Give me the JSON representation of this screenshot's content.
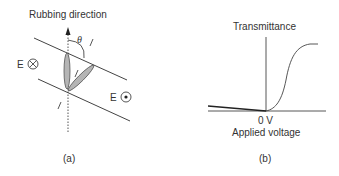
{
  "panel_a": {
    "caption": "(a)",
    "title": "Rubbing direction",
    "angle_label": "θ",
    "field_left": "E",
    "field_left_symbol": "into-page-icon",
    "field_right": "E",
    "field_right_symbol": "out-of-page-icon"
  },
  "panel_b": {
    "caption": "(b)",
    "y_axis_label": "Transmittance",
    "x_tick_label": "0 V",
    "x_axis_label": "Applied voltage"
  },
  "colors": {
    "line": "#444444",
    "molecule_fill": "#b5b5b5",
    "text": "#333333"
  }
}
